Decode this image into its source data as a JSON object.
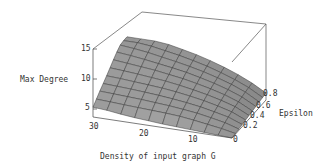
{
  "chart_data": {
    "type": "surface3d",
    "title": "",
    "xlabel": "Density of input graph G",
    "ylabel": "Epsilon",
    "zlabel": "Max Degree",
    "x_ticks": [
      "30",
      "20",
      "10",
      "0"
    ],
    "y_ticks": [
      "0",
      "0.2",
      "0.4",
      "0.6",
      "0.8"
    ],
    "z_ticks": [
      "5",
      "10",
      "15"
    ],
    "xlim": [
      0,
      30
    ],
    "ylim": [
      0,
      1
    ],
    "zlim": [
      4,
      16
    ],
    "grid": false,
    "surface_color": "#a8a8a8",
    "x": [
      0,
      3,
      6,
      9,
      12,
      15,
      18,
      21,
      24,
      27,
      30
    ],
    "y": [
      0,
      0.1,
      0.2,
      0.3,
      0.4,
      0.5,
      0.6,
      0.7,
      0.8,
      0.9,
      1.0
    ],
    "z": [
      [
        4.0,
        4.2,
        4.4,
        4.6,
        4.8,
        5.0,
        5.3,
        5.6,
        6.0,
        6.5,
        6.8
      ],
      [
        4.2,
        5.0,
        5.6,
        6.2,
        6.7,
        7.0,
        7.2,
        7.4,
        7.6,
        7.8,
        8.0
      ],
      [
        4.4,
        5.6,
        6.4,
        7.1,
        7.6,
        8.0,
        8.3,
        8.6,
        8.8,
        9.0,
        9.2
      ],
      [
        4.6,
        6.1,
        7.0,
        7.8,
        8.4,
        8.9,
        9.3,
        9.6,
        9.9,
        10.1,
        10.3
      ],
      [
        4.8,
        6.5,
        7.6,
        8.5,
        9.2,
        9.8,
        10.3,
        10.6,
        10.9,
        11.2,
        11.4
      ],
      [
        5.0,
        6.9,
        8.1,
        9.1,
        9.9,
        10.6,
        11.2,
        11.6,
        12.0,
        12.3,
        12.6
      ],
      [
        5.2,
        7.2,
        8.6,
        9.7,
        10.6,
        11.4,
        12.0,
        12.6,
        13.0,
        13.4,
        13.8
      ],
      [
        5.4,
        7.5,
        9.0,
        10.2,
        11.2,
        12.1,
        12.8,
        13.4,
        14.0,
        14.5,
        14.9
      ],
      [
        5.6,
        7.8,
        9.4,
        10.7,
        11.8,
        12.7,
        13.5,
        14.2,
        14.9,
        15.4,
        15.8
      ],
      [
        5.8,
        8.0,
        9.7,
        11.1,
        12.3,
        13.3,
        14.2,
        14.9,
        15.6,
        16.0,
        16.0
      ],
      [
        6.0,
        8.2,
        10.0,
        11.5,
        12.8,
        13.9,
        14.8,
        15.6,
        16.0,
        16.0,
        16.0
      ]
    ]
  },
  "labels": {
    "zlabel": "Max Degree",
    "ylabel": "Epsilon",
    "xlabel": "Density of input graph G",
    "z5": "5",
    "z10": "10",
    "z15": "15",
    "x30": "30",
    "x20": "20",
    "x10": "10",
    "y0": "0",
    "y02": "0.2",
    "y04": "0.4",
    "y06": "0.6",
    "y08": "0.8"
  }
}
